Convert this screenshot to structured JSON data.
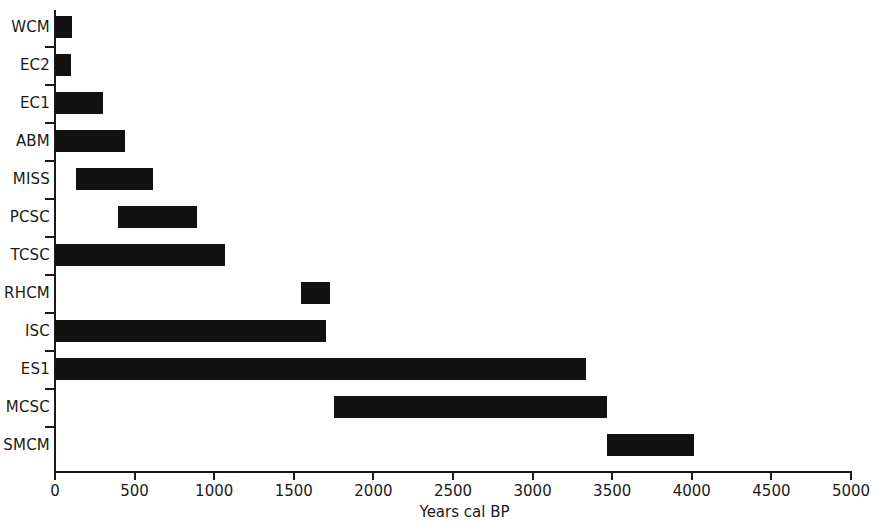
{
  "chart_data": {
    "type": "bar",
    "orientation": "horizontal",
    "subtype": "range-bar",
    "title": "",
    "subtitle": "",
    "xlabel": "Years cal BP",
    "ylabel": "",
    "xlim": [
      0,
      5000
    ],
    "xticks": [
      0,
      500,
      1000,
      1500,
      2000,
      2500,
      3000,
      3500,
      4000,
      4500,
      5000
    ],
    "xtick_labels": [
      "0",
      "500",
      "1000",
      "1500",
      "2000",
      "2500",
      "3000",
      "3500",
      "4000",
      "4500",
      "5000"
    ],
    "grid": false,
    "legend": null,
    "bar_color": "#111111",
    "axis_color": "#1a1a1a",
    "categories": [
      "WCM",
      "EC2",
      "EC1",
      "ABM",
      "MISS",
      "PCSC",
      "TCSC",
      "RHCM",
      "ISC",
      "ES1",
      "MCSC",
      "SMCM"
    ],
    "bars": [
      {
        "label": "WCM",
        "start": 0,
        "end": 105
      },
      {
        "label": "EC2",
        "start": 0,
        "end": 100
      },
      {
        "label": "EC1",
        "start": 0,
        "end": 300
      },
      {
        "label": "ABM",
        "start": 0,
        "end": 440
      },
      {
        "label": "MISS",
        "start": 130,
        "end": 615
      },
      {
        "label": "PCSC",
        "start": 395,
        "end": 890
      },
      {
        "label": "TCSC",
        "start": 0,
        "end": 1070
      },
      {
        "label": "RHCM",
        "start": 1545,
        "end": 1730
      },
      {
        "label": "ISC",
        "start": 0,
        "end": 1705
      },
      {
        "label": "ES1",
        "start": 0,
        "end": 3335
      },
      {
        "label": "MCSC",
        "start": 1755,
        "end": 3470
      },
      {
        "label": "SMCM",
        "start": 3470,
        "end": 4015
      }
    ]
  }
}
